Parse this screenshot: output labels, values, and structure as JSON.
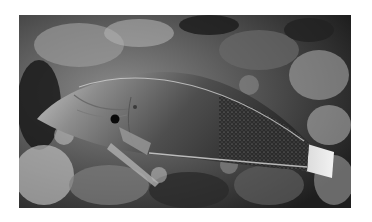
{
  "image": {
    "subject": "wrasse fish resting on coral reef",
    "style": "grayscale photograph",
    "alt": "Grayscale photo of a wrasse fish lying on coral rubble",
    "colors": {
      "background": "#ffffff",
      "reef_dark": "#1c1c1c",
      "reef_mid": "#6b6b6b",
      "reef_light": "#c9c9c9",
      "fish_body": "#5a5a5a",
      "fish_head": "#bdbdbd",
      "fish_tail": "#e6e6e6",
      "eye": "#0a0a0a"
    }
  }
}
